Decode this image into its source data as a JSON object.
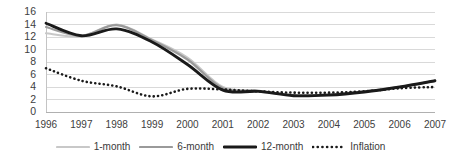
{
  "chart_data": {
    "type": "line",
    "title": "",
    "subtitle": "",
    "xlabel": "",
    "ylabel": "",
    "xlim": [
      1996,
      2007
    ],
    "ylim": [
      0,
      16
    ],
    "ytick_step": 2,
    "grid": true,
    "grid_color": "#d9d9d9",
    "background": "#ffffff",
    "legend_position": "bottom",
    "categories": [
      "1996",
      "1997",
      "1998",
      "1999",
      "2000",
      "2001",
      "2002",
      "2003",
      "2004",
      "2005",
      "2006",
      "2007"
    ],
    "x": [
      1996,
      1997,
      1998,
      1999,
      2000,
      2001,
      2002,
      2003,
      2004,
      2005,
      2006,
      2007
    ],
    "ytick_labels": [
      "16",
      "14",
      "12",
      "10",
      "8",
      "6",
      "4",
      "2",
      "0"
    ],
    "ytick_values": [
      16,
      14,
      12,
      10,
      8,
      6,
      4,
      2,
      0
    ],
    "series": [
      {
        "name": "1-month",
        "color": "#c8c8c8",
        "width": 2.2,
        "dash": "none",
        "values": [
          12.6,
          12.1,
          14.0,
          11.6,
          8.7,
          4.0,
          3.4,
          2.7,
          2.8,
          3.3,
          4.0,
          5.0
        ]
      },
      {
        "name": "6-month",
        "color": "#9a9a9a",
        "width": 2.2,
        "dash": "none",
        "values": [
          13.6,
          12.2,
          13.9,
          11.5,
          8.4,
          3.8,
          3.4,
          2.7,
          2.8,
          3.3,
          4.0,
          5.0
        ]
      },
      {
        "name": "12-month",
        "color": "#1a1a1a",
        "width": 2.8,
        "dash": "none",
        "values": [
          14.2,
          12.2,
          13.3,
          11.2,
          7.6,
          3.5,
          3.3,
          2.6,
          2.7,
          3.2,
          4.0,
          5.0
        ]
      },
      {
        "name": "Inflation",
        "color": "#1a1a1a",
        "width": 2.6,
        "dash": "dotted",
        "values": [
          7.0,
          5.0,
          4.1,
          2.5,
          3.7,
          3.6,
          3.3,
          3.1,
          3.1,
          3.3,
          3.8,
          4.0
        ]
      }
    ]
  },
  "legend": {
    "items": [
      {
        "label": "1-month"
      },
      {
        "label": "6-month"
      },
      {
        "label": "12-month"
      },
      {
        "label": "Inflation"
      }
    ]
  }
}
